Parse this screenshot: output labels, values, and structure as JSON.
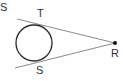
{
  "diagram": {
    "labels": {
      "corner": "S",
      "tangent_top": "T",
      "tangent_bottom": "S",
      "external_point": "R"
    },
    "colors": {
      "circle": "#2a2a2a",
      "lines": "#8a8a8a",
      "point": "#111111",
      "text": "#333333"
    }
  }
}
